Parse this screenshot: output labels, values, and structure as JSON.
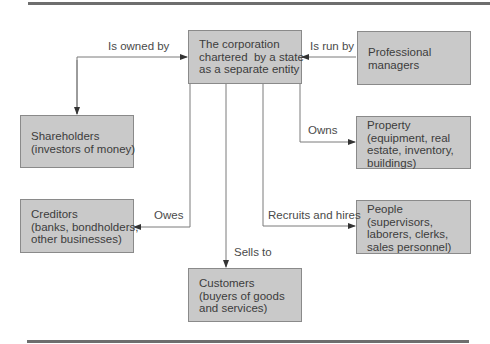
{
  "diagram": {
    "nodes": {
      "corporation": {
        "text": "The corporation\nchartered  by a state\nas a separate entity"
      },
      "managers": {
        "text": "Professional\nmanagers"
      },
      "shareholders": {
        "text": "Shareholders\n(investors of money)"
      },
      "property": {
        "text": "Property\n(equipment, real\nestate, inventory,\nbuildings)"
      },
      "creditors": {
        "text": "Creditors\n(banks, bondholders,\nother businesses)"
      },
      "people": {
        "text": "People\n(supervisors,\nlaborers, clerks,\nsales personnel)"
      },
      "customers": {
        "text": "Customers\n(buyers of goods\nand services)"
      }
    },
    "edges": {
      "owned_by": {
        "label": "Is owned by",
        "from": "shareholders",
        "to": "corporation"
      },
      "run_by": {
        "label": "Is run by",
        "from": "managers",
        "to": "corporation"
      },
      "owns": {
        "label": "Owns",
        "from": "corporation",
        "to": "property"
      },
      "owes": {
        "label": "Owes",
        "from": "corporation",
        "to": "creditors"
      },
      "recruits": {
        "label": "Recruits and hires",
        "from": "corporation",
        "to": "people"
      },
      "sells_to": {
        "label": "Sells to",
        "from": "corporation",
        "to": "customers"
      }
    },
    "colors": {
      "box_fill": "#c9c9c9",
      "box_border": "#8a8a8a",
      "line": "#7a7a7a",
      "rule": "#6e6e6e"
    }
  }
}
